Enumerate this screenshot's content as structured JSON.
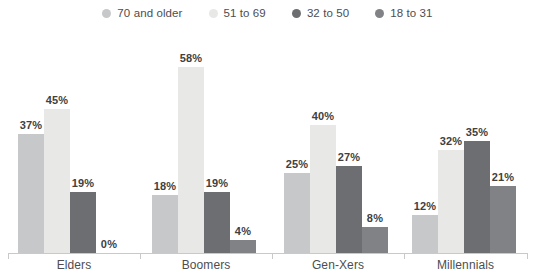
{
  "chart_data": {
    "type": "bar",
    "title": "",
    "subtitle": "",
    "xlabel": "",
    "ylabel": "",
    "ylim": [
      0,
      58
    ],
    "grid": false,
    "legend_position": "top",
    "value_suffix": "%",
    "categories": [
      "Elders",
      "Boomers",
      "Gen-Xers",
      "Millennials"
    ],
    "series": [
      {
        "name": "70 and older",
        "color": "#c7c8ca",
        "values": [
          37,
          18,
          25,
          12
        ],
        "labels": [
          "37%",
          "18%",
          "25%",
          "12%"
        ]
      },
      {
        "name": "51 to 69",
        "color": "#e8e9e6",
        "values": [
          45,
          58,
          40,
          32
        ],
        "labels": [
          "45%",
          "58%",
          "40%",
          "32%"
        ]
      },
      {
        "name": "32 to 50",
        "color": "#6d6e71",
        "values": [
          19,
          19,
          27,
          35
        ],
        "labels": [
          "19%",
          "19%",
          "27%",
          "35%"
        ]
      },
      {
        "name": "18 to 31",
        "color": "#808285",
        "values": [
          0,
          4,
          8,
          21
        ],
        "labels": [
          "0%",
          "4%",
          "8%",
          "21%"
        ]
      }
    ]
  },
  "legend": {
    "items": [
      {
        "label": "70 and older",
        "color": "#c7c8ca"
      },
      {
        "label": "51 to 69",
        "color": "#e8e9e6"
      },
      {
        "label": "32 to 50",
        "color": "#6d6e71"
      },
      {
        "label": "18 to 31",
        "color": "#808285"
      }
    ]
  },
  "axis": {
    "categories": [
      "Elders",
      "Boomers",
      "Gen-Xers",
      "Millennials"
    ]
  }
}
